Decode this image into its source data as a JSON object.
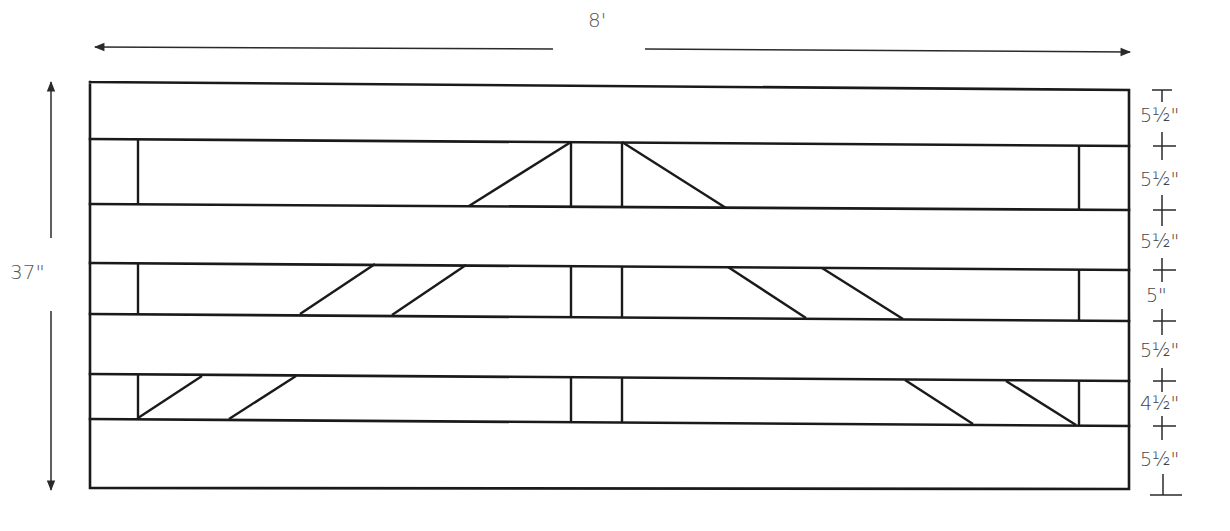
{
  "diagram": {
    "overall_width_label": "8'",
    "overall_height_label": "37\"",
    "colors": {
      "line": "#1a1a1a",
      "text": "#555555",
      "background": "#ffffff"
    },
    "vertical_segments": [
      {
        "label": "5½\"",
        "part": "top board"
      },
      {
        "label": "5½\"",
        "part": "gap 1"
      },
      {
        "label": "5½\"",
        "part": "board 2"
      },
      {
        "label": "5\"",
        "part": "gap 2"
      },
      {
        "label": "5½\"",
        "part": "board 3"
      },
      {
        "label": "4½\"",
        "part": "gap 3"
      },
      {
        "label": "5½\"",
        "part": "bottom board"
      }
    ],
    "components": {
      "horizontal_boards": 4,
      "end_uprights": 2,
      "center_uprights": 2,
      "diagonal_braces": 10
    }
  }
}
